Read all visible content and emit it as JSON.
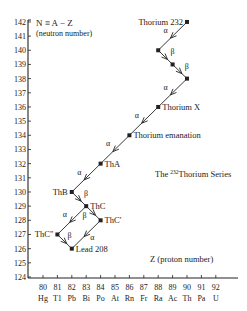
{
  "chart_data": {
    "type": "diagram",
    "title": "The 232Thorium Series",
    "title_prefix": "The ",
    "title_sup": "232",
    "title_suffix": "Thorium Series",
    "ylabel_line1": "N ≡ A − Z",
    "ylabel_line2": "(neutron number)",
    "xlabel": "Z (proton number)",
    "xlim": [
      80,
      92
    ],
    "ylim": [
      124,
      142
    ],
    "x_ticks": [
      80,
      81,
      82,
      83,
      84,
      85,
      86,
      87,
      88,
      89,
      90,
      91,
      92
    ],
    "x_elements": [
      "Hg",
      "T1",
      "Pb",
      "Bi",
      "Po",
      "At",
      "Rn",
      "Fr",
      "Ra",
      "Ac",
      "Th",
      "Pa",
      "U"
    ],
    "y_ticks": [
      124,
      125,
      126,
      127,
      128,
      129,
      130,
      131,
      132,
      133,
      134,
      135,
      136,
      137,
      138,
      139,
      140,
      141,
      142
    ],
    "nuclides": [
      {
        "id": "th232",
        "label": "Thorium 232",
        "Z": 90,
        "N": 142,
        "label_pos": "left"
      },
      {
        "id": "p1",
        "label": "",
        "Z": 88,
        "N": 140
      },
      {
        "id": "p2",
        "label": "",
        "Z": 89,
        "N": 139
      },
      {
        "id": "p3",
        "label": "",
        "Z": 90,
        "N": 138
      },
      {
        "id": "thx",
        "label": "Thorium X",
        "Z": 88,
        "N": 136,
        "label_pos": "right"
      },
      {
        "id": "them",
        "label": "Thorium emanation",
        "Z": 86,
        "N": 134,
        "label_pos": "right"
      },
      {
        "id": "tha",
        "label": "ThA",
        "Z": 84,
        "N": 132,
        "label_pos": "right"
      },
      {
        "id": "thb",
        "label": "ThB",
        "Z": 82,
        "N": 130,
        "label_pos": "left"
      },
      {
        "id": "thc",
        "label": "ThC",
        "Z": 83,
        "N": 129,
        "label_pos": "right"
      },
      {
        "id": "thc1",
        "label": "ThC'",
        "Z": 84,
        "N": 128,
        "label_pos": "right"
      },
      {
        "id": "thc2",
        "label": "ThC\"",
        "Z": 81,
        "N": 127,
        "label_pos": "left"
      },
      {
        "id": "pb208",
        "label": "Lead 208",
        "Z": 82,
        "N": 126,
        "label_pos": "right"
      }
    ],
    "decays": [
      {
        "from": "th232",
        "to": "p1",
        "type": "α"
      },
      {
        "from": "p1",
        "to": "p2",
        "type": "β"
      },
      {
        "from": "p2",
        "to": "p3",
        "type": "β"
      },
      {
        "from": "p3",
        "to": "thx",
        "type": "α"
      },
      {
        "from": "thx",
        "to": "them",
        "type": "α"
      },
      {
        "from": "them",
        "to": "tha",
        "type": "α"
      },
      {
        "from": "tha",
        "to": "thb",
        "type": "α"
      },
      {
        "from": "thb",
        "to": "thc",
        "type": "β"
      },
      {
        "from": "thc",
        "to": "thc1",
        "type": "β"
      },
      {
        "from": "thc",
        "to": "thc2",
        "type": "α"
      },
      {
        "from": "thc1",
        "to": "pb208",
        "type": "α"
      },
      {
        "from": "thc2",
        "to": "pb208",
        "type": "β"
      }
    ],
    "colors": {
      "ink": "#222222",
      "background": "#ffffff"
    }
  }
}
